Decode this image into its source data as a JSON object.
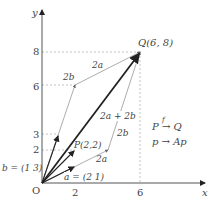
{
  "diagram": {
    "axes": {
      "x_label": "x",
      "y_label": "y",
      "origin_label": "O"
    },
    "ticks": {
      "x": [
        "2",
        "6"
      ],
      "y": [
        "8",
        "6",
        "3",
        "2"
      ]
    },
    "points": {
      "P": {
        "label": "P(2,2)",
        "coords": [
          2,
          2
        ]
      },
      "Q": {
        "label": "Q(6, 8)",
        "coords": [
          6,
          8
        ]
      }
    },
    "vectors": {
      "a": {
        "label": "a = (2 1)",
        "coords": [
          2,
          1
        ]
      },
      "b": {
        "label": "b = (1 3)",
        "coords": [
          1,
          3
        ]
      }
    },
    "vector_labels": {
      "two_a_top": "2a",
      "two_b_left": "2b",
      "two_a_bottom": "2a",
      "two_b_right": "2b",
      "sum": "2a + 2b"
    },
    "mapping": {
      "line1": "P → Q",
      "map_symbol": "f",
      "line2": "p → Ap"
    },
    "colors": {
      "axis": "#555555",
      "thick": "#222222",
      "thin": "#888888",
      "dotted": "#aaaaaa"
    }
  }
}
